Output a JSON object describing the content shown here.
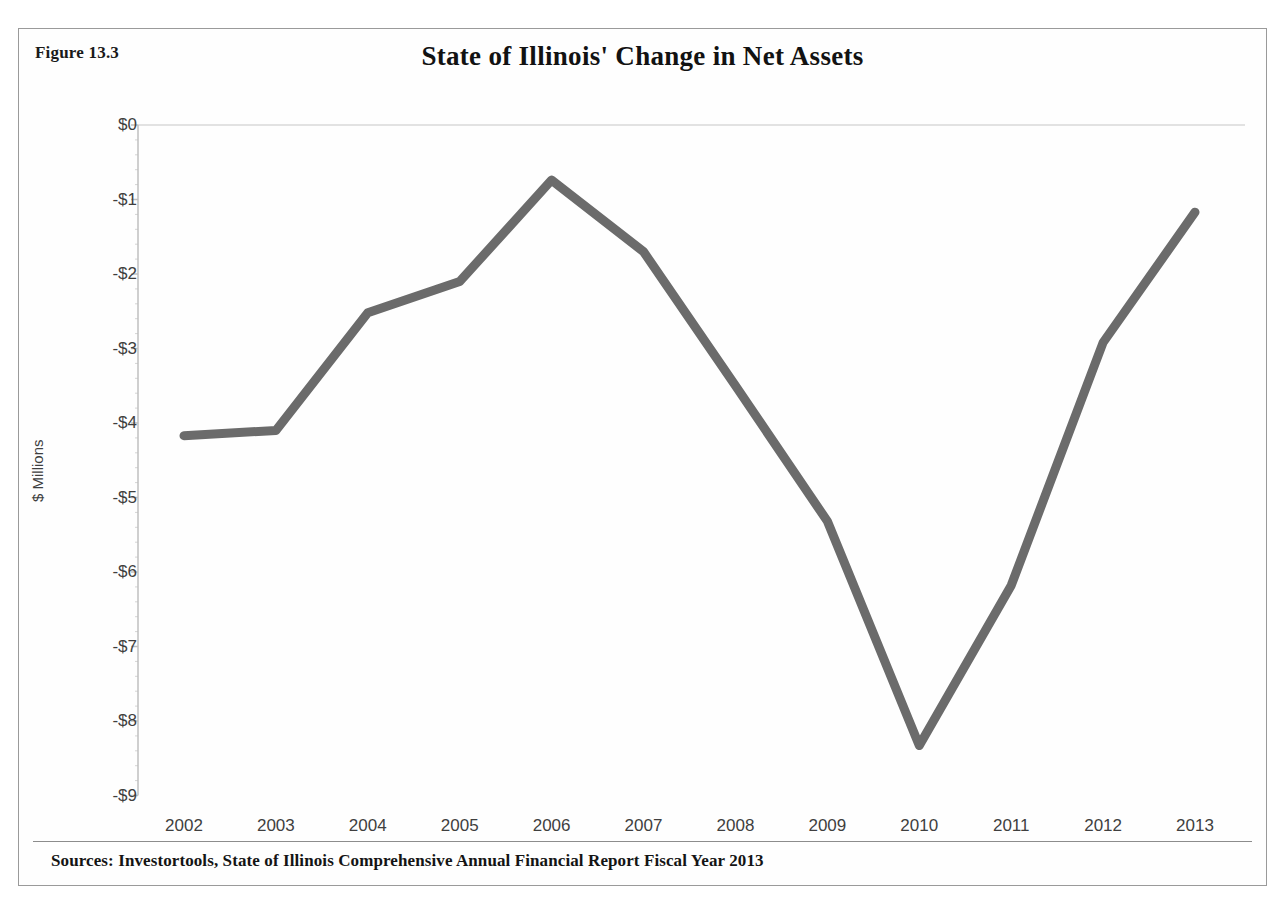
{
  "figure": {
    "label": "Figure 13.3"
  },
  "source": {
    "text": "Sources: Investortools, State of Illinois Comprehensive Annual Financial Report Fiscal Year 2013"
  },
  "style": {
    "line_color": "#6b6b6b",
    "axis_color": "#bfbfbf",
    "gridline_color": "#d9d9d9",
    "tick_text_color": "#3f3f3f",
    "title_color": "#121212"
  },
  "chart_data": {
    "type": "line",
    "title": "State of Illinois' Change in Net Assets",
    "xlabel": "",
    "ylabel": "$ Millions",
    "categories": [
      "2002",
      "2003",
      "2004",
      "2005",
      "2006",
      "2007",
      "2008",
      "2009",
      "2010",
      "2011",
      "2012",
      "2013"
    ],
    "values": [
      -4.17,
      -4.1,
      -2.52,
      -2.1,
      -0.74,
      -1.7,
      -3.5,
      -5.32,
      -8.33,
      -6.18,
      -2.92,
      -1.17
    ],
    "series": [
      {
        "name": "Change in Net Assets",
        "values": [
          -4.17,
          -4.1,
          -2.52,
          -2.1,
          -0.74,
          -1.7,
          -3.5,
          -5.32,
          -8.33,
          -6.18,
          -2.92,
          -1.17
        ]
      }
    ],
    "ytick_labels": [
      "$0",
      "-$1",
      "-$2",
      "-$3",
      "-$4",
      "-$5",
      "-$6",
      "-$7",
      "-$8",
      "-$9"
    ],
    "ytick_values": [
      0,
      -1,
      -2,
      -3,
      -4,
      -5,
      -6,
      -7,
      -8,
      -9
    ],
    "ylim": [
      -9,
      0
    ],
    "xlim": [
      "2002",
      "2013"
    ],
    "grid": "top-axis-line-only",
    "legend": "none",
    "markers": "none",
    "line_width_px": 9
  }
}
